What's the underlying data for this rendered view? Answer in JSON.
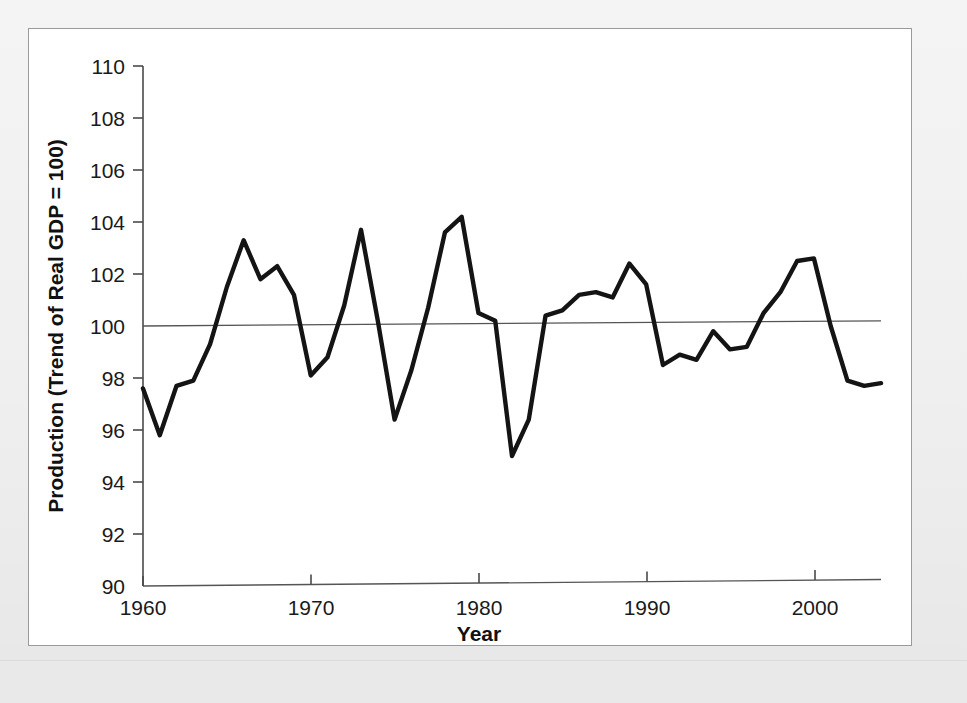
{
  "figure": {
    "background_color": "#efefef",
    "card_color": "#ffffff",
    "border_color": "#9a9a9a"
  },
  "axes": {
    "x_title": "Year",
    "y_title": "Production (Trend of Real GDP = 100)",
    "x_tick_labels": [
      "1960",
      "1970",
      "1980",
      "1990",
      "2000"
    ],
    "y_tick_labels": [
      "90",
      "92",
      "94",
      "96",
      "98",
      "100",
      "102",
      "104",
      "106",
      "108",
      "110"
    ]
  },
  "chart_data": {
    "type": "line",
    "title": "",
    "subtitle": "",
    "xlabel": "Year",
    "ylabel": "Production (Trend of Real GDP = 100)",
    "xlim": [
      1960,
      2004
    ],
    "ylim": [
      90,
      110
    ],
    "xticks": [
      1960,
      1970,
      1980,
      1990,
      2000
    ],
    "yticks": [
      90,
      92,
      94,
      96,
      98,
      100,
      102,
      104,
      106,
      108,
      110
    ],
    "grid": false,
    "legend": false,
    "legend_position": "none",
    "line_color": "#141414",
    "reference_line_color": "#555555",
    "annotations": [
      "Horizontal reference line drawn at trend value 100 (slightly upward sloping)",
      "Second near-horizontal line along the 90 baseline"
    ],
    "series": [
      {
        "name": "Production (Trend of Real GDP = 100)",
        "x": [
          1960,
          1961,
          1962,
          1963,
          1964,
          1965,
          1966,
          1967,
          1968,
          1969,
          1970,
          1971,
          1972,
          1973,
          1974,
          1975,
          1976,
          1977,
          1978,
          1979,
          1980,
          1981,
          1982,
          1983,
          1984,
          1985,
          1986,
          1987,
          1988,
          1989,
          1990,
          1991,
          1992,
          1993,
          1994,
          1995,
          1996,
          1997,
          1998,
          1999,
          2000,
          2001,
          2002,
          2003,
          2004
        ],
        "values": [
          97.6,
          95.8,
          97.7,
          97.9,
          99.3,
          101.5,
          103.3,
          101.8,
          102.3,
          101.2,
          98.1,
          98.8,
          100.8,
          103.7,
          100.2,
          96.4,
          98.3,
          100.7,
          103.6,
          104.2,
          100.5,
          100.2,
          95.0,
          96.4,
          100.4,
          100.6,
          101.2,
          101.3,
          101.1,
          102.4,
          101.6,
          98.5,
          98.9,
          98.7,
          99.8,
          99.1,
          99.2,
          100.5,
          101.3,
          102.5,
          102.6,
          100.0,
          97.9,
          97.7,
          97.8
        ]
      }
    ],
    "reference_line": {
      "name": "trend = 100",
      "x": [
        1960,
        2004
      ],
      "values": [
        100.0,
        100.2
      ]
    },
    "baseline_line": {
      "name": "baseline",
      "x": [
        1960,
        2004
      ],
      "values": [
        90.0,
        90.25
      ]
    }
  }
}
